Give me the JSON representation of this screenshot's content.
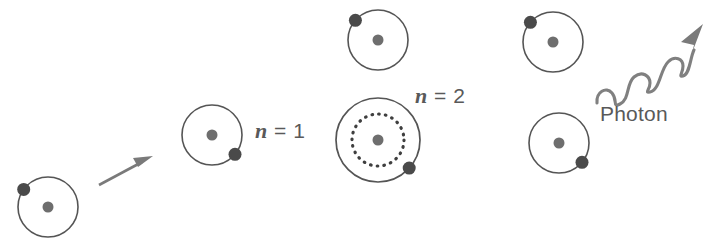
{
  "figure": {
    "width": 722,
    "height": 243,
    "background_color": "#ffffff"
  },
  "colors": {
    "orbit_stroke": "#555555",
    "nucleus_fill": "#6e6e6e",
    "electron_fill": "#4a4a4a",
    "arrow_fill": "#7a7a7a",
    "wave_stroke": "#808080",
    "text": "#595959"
  },
  "labels": [
    {
      "name": "label-n1",
      "variable": "n",
      "equals": " = 1",
      "text": "n = 1",
      "x": 255,
      "y": 120
    },
    {
      "name": "label-n2",
      "variable": "n",
      "equals": " = 2",
      "text": "n = 2",
      "x": 415,
      "y": 85
    },
    {
      "name": "label-photon",
      "text": "Photon",
      "x": 600,
      "y": 103
    }
  ],
  "atoms": [
    {
      "id": "atom-ground-state",
      "label": "ground state atom",
      "cx": 48,
      "cy": 207,
      "orbit_radius": 30,
      "nucleus_radius": 5.5,
      "electron": {
        "angle_deg": 216,
        "radius": 6.5
      },
      "inner_orbit_dotted": false
    },
    {
      "id": "atom-n1",
      "label": "atom at n = 1",
      "cx": 212,
      "cy": 135,
      "orbit_radius": 30,
      "nucleus_radius": 5.5,
      "electron": {
        "angle_deg": 40,
        "radius": 6.5
      },
      "inner_orbit_dotted": false
    },
    {
      "id": "atom-absorbing",
      "label": "atom absorbing energy",
      "cx": 378,
      "cy": 40,
      "orbit_radius": 30,
      "nucleus_radius": 5.5,
      "electron": {
        "angle_deg": 221,
        "radius": 6.5
      },
      "inner_orbit_dotted": false
    },
    {
      "id": "atom-n2-excited",
      "label": "excited atom at n = 2",
      "cx": 378,
      "cy": 140,
      "orbit_radius": 42,
      "nucleus_radius": 5.5,
      "electron": {
        "angle_deg": 42,
        "radius": 6.5
      },
      "inner_orbit_dotted": true,
      "inner_orbit_radius": 26
    },
    {
      "id": "atom-excited-upper-right",
      "label": "excited atom before emission",
      "cx": 553,
      "cy": 42,
      "orbit_radius": 30,
      "nucleus_radius": 5.5,
      "electron": {
        "angle_deg": 221,
        "radius": 6.5
      },
      "inner_orbit_dotted": false
    },
    {
      "id": "atom-after-emission",
      "label": "atom after photon emission",
      "cx": 559,
      "cy": 143,
      "orbit_radius": 30,
      "nucleus_radius": 5.5,
      "electron": {
        "angle_deg": 40,
        "radius": 6.5
      },
      "inner_orbit_dotted": false
    }
  ],
  "arrows": [
    {
      "id": "incoming-arrow",
      "label": "incoming energy arrow",
      "type": "straight",
      "x1": 99,
      "y1": 185,
      "x2": 151,
      "y2": 157
    }
  ],
  "wave": {
    "id": "photon-wave-arrow",
    "label": "emitted photon wave arrow",
    "type": "sine-arrow",
    "start_x": 597,
    "start_y": 100,
    "end_x": 700,
    "end_y": 22,
    "cycles": 3.5
  }
}
